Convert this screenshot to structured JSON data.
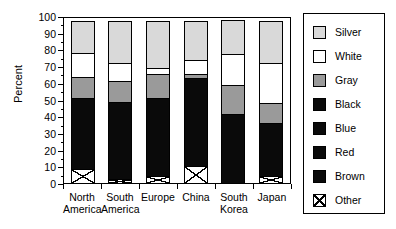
{
  "chart_data": {
    "type": "bar",
    "subtype": "stacked-bar-100",
    "title": "",
    "xlabel": "",
    "ylabel": "Percent",
    "ylim": [
      0,
      100
    ],
    "ytick_step": 10,
    "yticks": [
      "0",
      "10",
      "20",
      "30",
      "40",
      "50",
      "60",
      "70",
      "80",
      "90",
      "100"
    ],
    "grid": false,
    "legend_position": "right",
    "categories": [
      "North America",
      "South America",
      "Europe",
      "China",
      "South Korea",
      "Japan"
    ],
    "category_lines": [
      [
        "North",
        "America"
      ],
      [
        "South",
        "America"
      ],
      [
        "Europe",
        ""
      ],
      [
        "China",
        ""
      ],
      [
        "South",
        "Korea"
      ],
      [
        "Japan",
        ""
      ]
    ],
    "series": [
      {
        "name": "Silver",
        "color": "#d9d9d9",
        "values": [
          20,
          26,
          29,
          24,
          21,
          26
        ]
      },
      {
        "name": "White",
        "color": "#ffffff",
        "values": [
          15,
          11,
          4,
          9,
          19,
          24
        ]
      },
      {
        "name": "Gray",
        "color": "#9a9a9a",
        "values": [
          13,
          13,
          15,
          3,
          18,
          13
        ]
      },
      {
        "name": "Black",
        "color": "#0a0a0a",
        "values": [
          43,
          47,
          47,
          53,
          42,
          32
        ]
      },
      {
        "name": "Blue",
        "color": "#0a0a0a",
        "values": [
          0,
          0,
          0,
          0,
          0,
          0
        ]
      },
      {
        "name": "Red",
        "color": "#0a0a0a",
        "values": [
          0,
          0,
          0,
          0,
          0,
          0
        ]
      },
      {
        "name": "Brown",
        "color": "#0a0a0a",
        "values": [
          0,
          0,
          0,
          0,
          0,
          0
        ]
      },
      {
        "name": "Other",
        "color": "hatch",
        "values": [
          9,
          3,
          5,
          11,
          0,
          5
        ]
      }
    ],
    "legend_entries": [
      {
        "label": "Silver",
        "swatch": "silver"
      },
      {
        "label": "White",
        "swatch": "white"
      },
      {
        "label": "Gray",
        "swatch": "gray"
      },
      {
        "label": "Black",
        "swatch": "black"
      },
      {
        "label": "Blue",
        "swatch": "blue"
      },
      {
        "label": "Red",
        "swatch": "red"
      },
      {
        "label": "Brown",
        "swatch": "brown"
      },
      {
        "label": "Other",
        "swatch": "other"
      }
    ]
  }
}
